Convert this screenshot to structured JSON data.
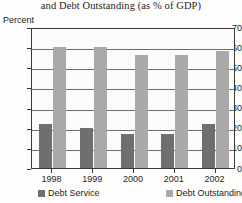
{
  "chart_data": {
    "type": "bar",
    "title": "and Debt Outstanding (as % of GDP)",
    "xlabel": "",
    "ylabel": "Percent",
    "categories": [
      "1998",
      "1999",
      "2000",
      "2001",
      "2002"
    ],
    "series": [
      {
        "name": "Debt Service",
        "color": "#6f6f6f",
        "values": [
          22,
          20,
          17,
          17,
          22
        ]
      },
      {
        "name": "Debt Outstanding",
        "color": "#a9a9a9",
        "values": [
          60,
          60,
          56,
          56,
          58
        ]
      }
    ],
    "ylim": [
      0,
      70
    ],
    "yticks": [
      0,
      10,
      20,
      30,
      40,
      50,
      60,
      70
    ],
    "ytick_labels": [
      "0",
      "10",
      "20",
      "30",
      "40",
      "50",
      "60",
      "70"
    ],
    "grid": true,
    "legend_position": "bottom"
  },
  "axes": {
    "y_title": "Percent"
  },
  "legend": {
    "entries": [
      {
        "label": "Debt Service",
        "color": "#6f6f6f"
      },
      {
        "label": "Debt Outstanding",
        "color": "#a9a9a9"
      }
    ]
  }
}
